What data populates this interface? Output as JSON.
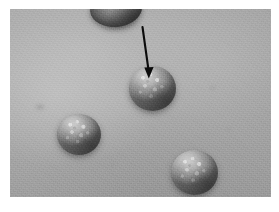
{
  "figure": {
    "kind": "clinical-photograph",
    "modality": "grayscale photograph",
    "caption": "",
    "dimensions": {
      "width_px": 279,
      "height_px": 212
    },
    "plate": {
      "left_px": 10,
      "top_px": 9,
      "width_px": 261,
      "height_px": 188
    }
  },
  "colors": {
    "page_background": "#ffffff",
    "skin_background": "#a8a8a8",
    "skin_highlight": "#c6c6c6",
    "skin_shadow": "#8c8c8c",
    "nodule_highlight": "#c2c2c2",
    "nodule_midtone": "#9a9a9a",
    "nodule_shadow": "#5d5d5d",
    "annotation": "#000000"
  },
  "annotation": {
    "type": "arrow",
    "label": "",
    "color": "#000000",
    "direction": "down",
    "points_to": "nodule-center",
    "tail_px": {
      "x": 133,
      "y": 18
    },
    "tip_px": {
      "x": 139,
      "y": 68
    },
    "length_px": 50,
    "line_width_px": 2
  },
  "lesions": [
    {
      "id": "nodule-top-partial",
      "name": "partial nodule at top edge",
      "position_px": {
        "x": 106,
        "y": 4
      },
      "size_px": {
        "width": 52,
        "height": 36
      },
      "cropped": true,
      "annotated": false,
      "surface": "smooth, in shadow"
    },
    {
      "id": "nodule-center",
      "name": "central nodule",
      "position_px": {
        "x": 143,
        "y": 79
      },
      "size_px": {
        "width": 47,
        "height": 45
      },
      "cropped": false,
      "annotated": true,
      "surface": "dome-shaped with pale keratotic speckling at apex"
    },
    {
      "id": "nodule-left",
      "name": "left nodule",
      "position_px": {
        "x": 69,
        "y": 125
      },
      "size_px": {
        "width": 44,
        "height": 41
      },
      "cropped": false,
      "annotated": false,
      "surface": "rounded with bright speckles and dark right-sided shadow"
    },
    {
      "id": "nodule-right",
      "name": "lower-right nodule",
      "position_px": {
        "x": 185,
        "y": 163
      },
      "size_px": {
        "width": 47,
        "height": 45
      },
      "cropped": false,
      "annotated": false,
      "surface": "ovoid, coarsely granular surface"
    }
  ],
  "background_marks": [
    {
      "id": "blemish-a",
      "position_px": {
        "x": 30,
        "y": 98
      }
    },
    {
      "id": "blemish-b",
      "position_px": {
        "x": 203,
        "y": 79
      }
    },
    {
      "id": "blemish-c",
      "position_px": {
        "x": 102,
        "y": 157
      }
    },
    {
      "id": "blemish-d",
      "position_px": {
        "x": 219,
        "y": 120
      }
    }
  ]
}
